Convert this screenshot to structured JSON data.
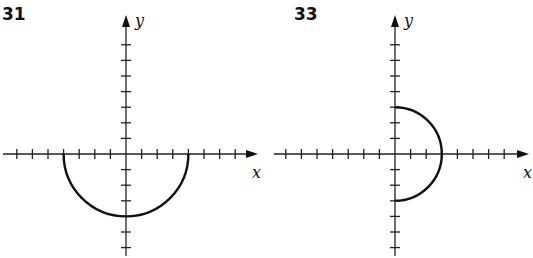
{
  "chart_data": [
    {
      "type": "line",
      "title": "31",
      "xlabel": "x",
      "ylabel": "y",
      "grid": false,
      "tick_spacing_units": 1,
      "x_ticks": [
        -7,
        -6,
        -5,
        -4,
        -3,
        -2,
        -1,
        1,
        2,
        3,
        4,
        5,
        6,
        7
      ],
      "y_ticks": [
        -6,
        -5,
        -4,
        -3,
        -2,
        -1,
        1,
        2,
        3,
        4,
        5,
        6,
        7
      ],
      "xlim": [
        -8,
        8.5
      ],
      "ylim": [
        -6.2,
        8.5
      ],
      "curve": {
        "shape": "lower semicircle",
        "center": [
          0,
          0
        ],
        "radius": 4,
        "from": [
          -4,
          0
        ],
        "through": [
          0,
          -4
        ],
        "to": [
          4,
          0
        ],
        "equation": "y = -sqrt(16 - x^2)"
      }
    },
    {
      "type": "line",
      "title": "33",
      "xlabel": "x",
      "ylabel": "y",
      "grid": false,
      "tick_spacing_units": 1,
      "x_ticks": [
        -7,
        -6,
        -5,
        -4,
        -3,
        -2,
        -1,
        1,
        2,
        3,
        4,
        5,
        6,
        7
      ],
      "y_ticks": [
        -6,
        -5,
        -4,
        -3,
        -2,
        -1,
        1,
        2,
        3,
        4,
        5,
        6,
        7
      ],
      "xlim": [
        -8,
        8.5
      ],
      "ylim": [
        -6.2,
        8.5
      ],
      "curve": {
        "shape": "right semicircle",
        "center": [
          0,
          0
        ],
        "radius": 3,
        "from": [
          0,
          3
        ],
        "through": [
          3,
          0
        ],
        "to": [
          0,
          -3
        ],
        "equation": "x = sqrt(9 - y^2)"
      }
    }
  ],
  "panels": [
    {
      "label": "31",
      "xlabel": "x",
      "ylabel": "y"
    },
    {
      "label": "33",
      "xlabel": "x",
      "ylabel": "y"
    }
  ]
}
